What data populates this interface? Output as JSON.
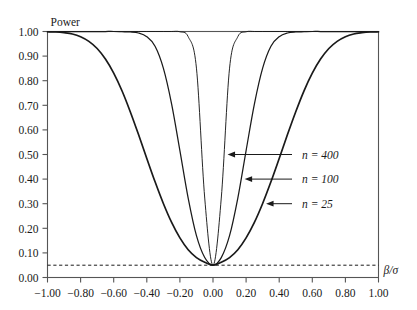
{
  "figure": {
    "background_color": "#ffffff",
    "ink_color": "#1a1a1a",
    "axis_color": "#555555"
  },
  "chart_data": {
    "type": "line",
    "title": "",
    "subtitle": "",
    "xlabel": "β/σ",
    "ylabel": "Power",
    "xlim": [
      -1.0,
      1.0
    ],
    "ylim": [
      0.0,
      1.0
    ],
    "grid": false,
    "legend_position": "inline-annotations-right",
    "xticks": [
      -1.0,
      -0.8,
      -0.6,
      -0.4,
      -0.2,
      0.0,
      0.2,
      0.4,
      0.6,
      0.8,
      1.0
    ],
    "xticklabels": [
      "−1.00",
      "−0.80",
      "−0.60",
      "−0.40",
      "−0.20",
      "0.00",
      "0.20",
      "0.40",
      "0.60",
      "0.80",
      "1.00"
    ],
    "yticks": [
      0.0,
      0.1,
      0.2,
      0.3,
      0.4,
      0.5,
      0.6,
      0.7,
      0.8,
      0.9,
      1.0
    ],
    "yticklabels": [
      "0.00",
      "0.10",
      "0.20",
      "0.30",
      "0.40",
      "0.50",
      "0.60",
      "0.70",
      "0.80",
      "0.90",
      "1.00"
    ],
    "reference_line": {
      "name": "significance-level",
      "value": 0.05,
      "style": "dashed",
      "orientation": "horizontal"
    },
    "x": [
      -1.0,
      -0.95,
      -0.9,
      -0.85,
      -0.8,
      -0.75,
      -0.7,
      -0.65,
      -0.6,
      -0.55,
      -0.5,
      -0.45,
      -0.4,
      -0.35,
      -0.3,
      -0.25,
      -0.2,
      -0.15,
      -0.1,
      -0.05,
      0.0,
      0.05,
      0.1,
      0.15,
      0.2,
      0.25,
      0.3,
      0.35,
      0.4,
      0.45,
      0.5,
      0.55,
      0.6,
      0.65,
      0.7,
      0.75,
      0.8,
      0.85,
      0.9,
      0.95,
      1.0
    ],
    "series": [
      {
        "name": "n = 25",
        "n": 25,
        "linewidth": 1.7,
        "values": [
          0.999,
          0.998,
          0.995,
          0.99,
          0.979,
          0.96,
          0.931,
          0.888,
          0.831,
          0.759,
          0.674,
          0.581,
          0.484,
          0.389,
          0.301,
          0.224,
          0.161,
          0.113,
          0.081,
          0.062,
          0.05,
          0.062,
          0.081,
          0.113,
          0.161,
          0.224,
          0.301,
          0.389,
          0.484,
          0.581,
          0.674,
          0.759,
          0.831,
          0.888,
          0.931,
          0.96,
          0.979,
          0.99,
          0.995,
          0.998,
          0.999
        ]
      },
      {
        "name": "n = 100",
        "n": 100,
        "linewidth": 1.25,
        "values": [
          1.0,
          1.0,
          1.0,
          1.0,
          1.0,
          1.0,
          1.0,
          1.0,
          1.0,
          0.999,
          0.998,
          0.994,
          0.979,
          0.94,
          0.851,
          0.705,
          0.516,
          0.323,
          0.17,
          0.081,
          0.05,
          0.081,
          0.17,
          0.323,
          0.516,
          0.705,
          0.851,
          0.94,
          0.979,
          0.994,
          0.998,
          0.999,
          1.0,
          1.0,
          1.0,
          1.0,
          1.0,
          1.0,
          1.0,
          1.0,
          1.0
        ]
      },
      {
        "name": "n = 400",
        "n": 400,
        "linewidth": 0.95,
        "values": [
          1.0,
          1.0,
          1.0,
          1.0,
          1.0,
          1.0,
          1.0,
          1.0,
          1.0,
          1.0,
          1.0,
          1.0,
          1.0,
          1.0,
          1.0,
          1.0,
          0.999,
          0.979,
          0.851,
          0.323,
          0.05,
          0.323,
          0.851,
          0.979,
          0.999,
          1.0,
          1.0,
          1.0,
          1.0,
          1.0,
          1.0,
          1.0,
          1.0,
          1.0,
          1.0,
          1.0,
          1.0,
          1.0,
          1.0,
          1.0,
          1.0
        ]
      }
    ],
    "annotations": [
      {
        "name": "annotation-n-400",
        "label": "n = 400",
        "points_to_series": "n = 400",
        "at_power": 0.5,
        "arrow_direction": "left"
      },
      {
        "name": "annotation-n-100",
        "label": "n = 100",
        "points_to_series": "n = 100",
        "at_power": 0.4,
        "arrow_direction": "left"
      },
      {
        "name": "annotation-n-25",
        "label": "n = 25",
        "points_to_series": "n = 25",
        "at_power": 0.3,
        "arrow_direction": "left"
      }
    ]
  }
}
